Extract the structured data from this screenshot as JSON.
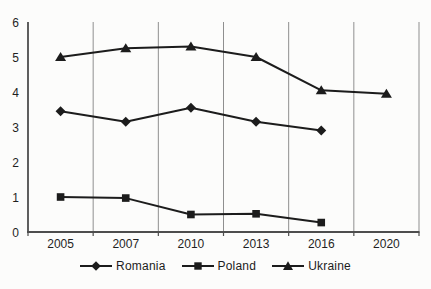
{
  "chart_data": {
    "type": "line",
    "title": "",
    "xlabel": "",
    "ylabel": "",
    "categories": [
      "2005",
      "2007",
      "2010",
      "2013",
      "2016",
      "2020"
    ],
    "series": [
      {
        "name": "Romania",
        "marker": "diamond",
        "values": [
          3.45,
          3.15,
          3.55,
          3.15,
          2.9,
          null
        ]
      },
      {
        "name": "Poland",
        "marker": "square",
        "values": [
          1.0,
          0.97,
          0.5,
          0.52,
          0.27,
          null
        ]
      },
      {
        "name": "Ukraine",
        "marker": "triangle",
        "values": [
          5.0,
          5.25,
          5.3,
          5.0,
          4.05,
          3.95
        ]
      }
    ],
    "ylim": [
      0,
      6
    ],
    "yticks": [
      0,
      1,
      2,
      3,
      4,
      5,
      6
    ],
    "grid": "vertical-lines-between-categories",
    "legend_position": "bottom",
    "colors": {
      "series_line": "#1c1c1c",
      "marker_fill": "#1c1c1c",
      "grid_line": "#8f8f8f",
      "axis_line": "#4d4d4d",
      "tick_label": "#1f1f1f",
      "background": "#fcfcfb"
    }
  }
}
